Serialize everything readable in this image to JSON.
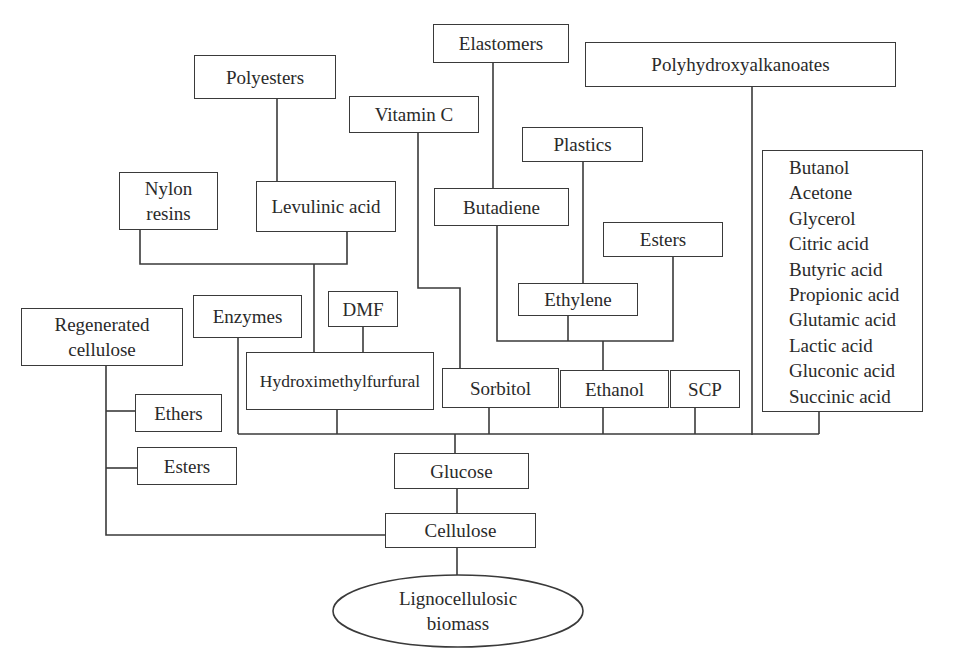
{
  "diagram": {
    "type": "tree",
    "root": "Lignocellulosic biomass",
    "nodes": {
      "elastomers": "Elastomers",
      "polyhydroxyalkanoates": "Polyhydroxyalkanoates",
      "polyesters": "Polyesters",
      "vitamin_c": "Vitamin C",
      "plastics": "Plastics",
      "nylon_resins": [
        "Nylon",
        "resins"
      ],
      "levulinic_acid": "Levulinic acid",
      "butadiene": "Butadiene",
      "esters_right": "Esters",
      "ethylene": "Ethylene",
      "regenerated_cellulose": [
        "Regenerated",
        "cellulose"
      ],
      "enzymes": "Enzymes",
      "dmf": "DMF",
      "hydroxymethylfurfural": "Hydroximethylfurfural",
      "sorbitol": "Sorbitol",
      "ethanol": "Ethanol",
      "scp": "SCP",
      "ethers": "Ethers",
      "esters_left": "Esters",
      "glucose": "Glucose",
      "cellulose": "Cellulose",
      "lignocellulosic_biomass": [
        "Lignocellulosic",
        "biomass"
      ]
    },
    "product_list": [
      "Butanol",
      "Acetone",
      "Glycerol",
      "Citric acid",
      "Butyric acid",
      "Propionic acid",
      "Glutamic acid",
      "Lactic acid",
      "Gluconic acid",
      "Succinic acid"
    ],
    "edges": [
      [
        "Lignocellulosic biomass",
        "Cellulose"
      ],
      [
        "Cellulose",
        "Glucose"
      ],
      [
        "Cellulose",
        "Regenerated cellulose"
      ],
      [
        "Cellulose",
        "Ethers"
      ],
      [
        "Cellulose",
        "Esters"
      ],
      [
        "Glucose",
        "Enzymes"
      ],
      [
        "Glucose",
        "Hydroximethylfurfural"
      ],
      [
        "Glucose",
        "Sorbitol"
      ],
      [
        "Glucose",
        "Ethanol"
      ],
      [
        "Glucose",
        "SCP"
      ],
      [
        "Glucose",
        "Polyhydroxyalkanoates"
      ],
      [
        "Glucose",
        "Product list"
      ],
      [
        "Hydroximethylfurfural",
        "DMF"
      ],
      [
        "Hydroximethylfurfural",
        "Levulinic acid"
      ],
      [
        "Hydroximethylfurfural",
        "Nylon resins"
      ],
      [
        "Levulinic acid",
        "Polyesters"
      ],
      [
        "Sorbitol",
        "Vitamin C"
      ],
      [
        "Ethanol",
        "Butadiene"
      ],
      [
        "Ethanol",
        "Ethylene"
      ],
      [
        "Ethanol",
        "Esters"
      ],
      [
        "Butadiene",
        "Elastomers"
      ],
      [
        "Ethylene",
        "Plastics"
      ]
    ]
  }
}
